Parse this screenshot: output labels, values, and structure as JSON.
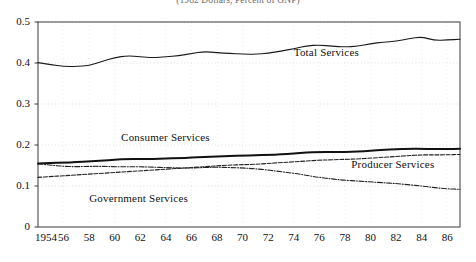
{
  "chart_data": {
    "type": "line",
    "title": "(1982 Dollars, Percent of GNP)",
    "xlabel": "",
    "ylabel": "",
    "xlim": [
      1954,
      1987
    ],
    "ylim": [
      0,
      0.5
    ],
    "grid": true,
    "legend_position": "inline-annotations",
    "x_ticks": [
      "1954",
      "56",
      "58",
      "60",
      "62",
      "64",
      "66",
      "68",
      "70",
      "72",
      "74",
      "76",
      "78",
      "80",
      "82",
      "84",
      "86"
    ],
    "x_tick_values": [
      1954,
      1956,
      1958,
      1960,
      1962,
      1964,
      1966,
      1968,
      1970,
      1972,
      1974,
      1976,
      1978,
      1980,
      1982,
      1984,
      1986
    ],
    "y_ticks": [
      "0",
      "0.1",
      "0.2",
      "0.3",
      "0.4",
      "0.5"
    ],
    "y_tick_values": [
      0,
      0.1,
      0.2,
      0.3,
      0.4,
      0.5
    ],
    "x": [
      1954,
      1955,
      1956,
      1957,
      1958,
      1959,
      1960,
      1961,
      1962,
      1963,
      1964,
      1965,
      1966,
      1967,
      1968,
      1969,
      1970,
      1971,
      1972,
      1973,
      1974,
      1975,
      1976,
      1977,
      1978,
      1979,
      1980,
      1981,
      1982,
      1983,
      1984,
      1985,
      1986,
      1987
    ],
    "series": [
      {
        "name": "Total Services",
        "style": "solid-thin",
        "color": "#1a1a1a",
        "values": [
          0.401,
          0.396,
          0.392,
          0.391,
          0.394,
          0.404,
          0.413,
          0.418,
          0.415,
          0.413,
          0.415,
          0.418,
          0.423,
          0.428,
          0.425,
          0.423,
          0.422,
          0.421,
          0.424,
          0.429,
          0.435,
          0.442,
          0.444,
          0.441,
          0.439,
          0.441,
          0.447,
          0.451,
          0.453,
          0.459,
          0.464,
          0.455,
          0.456,
          0.458
        ]
      },
      {
        "name": "Consumer Services",
        "style": "solid-thick",
        "color": "#111111",
        "values": [
          0.155,
          0.156,
          0.157,
          0.158,
          0.16,
          0.162,
          0.164,
          0.166,
          0.166,
          0.166,
          0.167,
          0.168,
          0.169,
          0.171,
          0.172,
          0.173,
          0.174,
          0.175,
          0.176,
          0.177,
          0.179,
          0.182,
          0.183,
          0.183,
          0.183,
          0.184,
          0.186,
          0.188,
          0.19,
          0.191,
          0.191,
          0.19,
          0.19,
          0.191
        ]
      },
      {
        "name": "Producer Services",
        "style": "dashed",
        "color": "#222222",
        "values": [
          0.121,
          0.123,
          0.125,
          0.127,
          0.129,
          0.131,
          0.133,
          0.135,
          0.137,
          0.139,
          0.141,
          0.143,
          0.145,
          0.147,
          0.149,
          0.151,
          0.152,
          0.153,
          0.155,
          0.157,
          0.159,
          0.161,
          0.163,
          0.164,
          0.165,
          0.166,
          0.168,
          0.17,
          0.172,
          0.174,
          0.176,
          0.176,
          0.176,
          0.177
        ]
      },
      {
        "name": "Government Services",
        "style": "dash-dot",
        "color": "#222222",
        "values": [
          0.154,
          0.151,
          0.148,
          0.147,
          0.148,
          0.148,
          0.147,
          0.147,
          0.147,
          0.146,
          0.145,
          0.144,
          0.144,
          0.145,
          0.146,
          0.145,
          0.144,
          0.142,
          0.139,
          0.135,
          0.131,
          0.126,
          0.121,
          0.117,
          0.114,
          0.112,
          0.11,
          0.108,
          0.106,
          0.103,
          0.1,
          0.096,
          0.093,
          0.092
        ]
      }
    ],
    "annotations": [
      {
        "text": "Total Services",
        "x": 1974.0,
        "y": 0.425
      },
      {
        "text": "Consumer Services",
        "x": 1960.5,
        "y": 0.218
      },
      {
        "text": "Producer Services",
        "x": 1978.5,
        "y": 0.152
      },
      {
        "text": "Government Services",
        "x": 1958.0,
        "y": 0.068
      }
    ]
  }
}
